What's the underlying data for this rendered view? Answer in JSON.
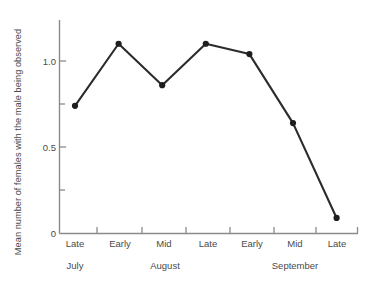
{
  "chart_data": {
    "type": "line",
    "title": "",
    "subtitle": "",
    "xlabel": "",
    "ylabel": "Mean number of females with the male being observed",
    "categories": [
      "Late",
      "Early",
      "Mid",
      "Late",
      "Early",
      "Mid",
      "Late"
    ],
    "values": [
      0.74,
      1.1,
      0.86,
      1.1,
      1.04,
      0.64,
      0.09
    ],
    "groups": [
      {
        "label": "July",
        "categories": [
          "Late"
        ]
      },
      {
        "label": "August",
        "categories": [
          "Early",
          "Mid",
          "Late"
        ]
      },
      {
        "label": "September",
        "categories": [
          "Early",
          "Mid",
          "Late"
        ]
      }
    ],
    "group_labels": [
      "July",
      "August",
      "September"
    ],
    "ylim": [
      0,
      1.25
    ],
    "yticks": [
      0,
      0.5,
      1.0
    ],
    "ytick_labels": [
      "0",
      "0.5",
      "1.0"
    ],
    "yminor_ticks": [
      0.25,
      0.75
    ],
    "grid": false,
    "legend": null,
    "legend_position": "none",
    "marker": "filled-circle",
    "colors": {
      "line": "#2b2b2b",
      "marker": "#1e1e1e",
      "axis": "#8a8a8a",
      "text": "#4a4a4a",
      "background": "#ffffff"
    }
  },
  "axis_icons": {
    "y_axis": "vertical-axis-line",
    "x_axis": "horizontal-axis-line"
  }
}
